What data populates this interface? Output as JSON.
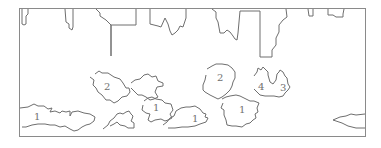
{
  "figure": {
    "type": "region-outline-map",
    "stroke_color": "#6e6e6e",
    "frame_color": "#8a8a8a",
    "background": "#ffffff"
  },
  "regions": [
    {
      "id": "r-left-1",
      "label": "1",
      "label_x": 37,
      "label_y": 119
    },
    {
      "id": "r-2-left",
      "label": "2",
      "label_x": 105,
      "label_y": 88
    },
    {
      "id": "r-mid-1a",
      "label": "1",
      "label_x": 155,
      "label_y": 108
    },
    {
      "id": "r-mid-1b",
      "label": "1",
      "label_x": 194,
      "label_y": 120
    },
    {
      "id": "r-2-right",
      "label": "2",
      "label_x": 219,
      "label_y": 78
    },
    {
      "id": "r-right-1",
      "label": "1",
      "label_x": 241,
      "label_y": 110
    },
    {
      "id": "r-4",
      "label": "4",
      "label_x": 260,
      "label_y": 88
    },
    {
      "id": "r-3",
      "label": "3",
      "label_x": 282,
      "label_y": 89
    },
    {
      "id": "r-small",
      "label": "",
      "label_x": 0,
      "label_y": 0
    },
    {
      "id": "r-edge",
      "label": "",
      "label_x": 0,
      "label_y": 0
    }
  ]
}
